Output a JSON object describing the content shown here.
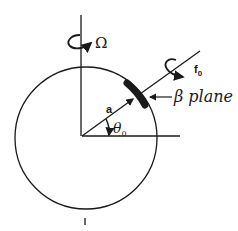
{
  "diagram": {
    "type": "rotating sphere with beta-plane patch",
    "labels": {
      "planet_rotation": "Ω",
      "local_rotation": "f",
      "local_rotation_subscript": "0",
      "beta_plane": "β plane",
      "radius": "a",
      "latitude": "θ",
      "latitude_subscript": "0"
    },
    "colors": {
      "ink": "#1a1a1a",
      "background": "#ffffff"
    }
  }
}
